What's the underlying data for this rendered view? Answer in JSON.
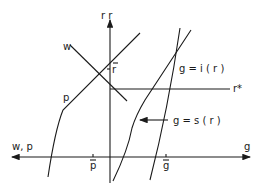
{
  "diagram": {
    "axes": {
      "vertical_label": "r  r",
      "horizontal_right_label": "g",
      "horizontal_left_label": "w, p"
    },
    "curves": {
      "w": "w",
      "p": "p",
      "i": "g = i ( r )",
      "s": "g = s ( r )",
      "r_star": "r*"
    },
    "ticks": {
      "r_bar": "-r",
      "p_bar": "p",
      "g_bar": "g"
    },
    "colors": {
      "line": "#1a1a1a",
      "background": "#ffffff"
    }
  }
}
